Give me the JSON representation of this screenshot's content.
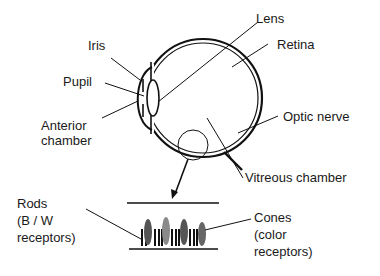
{
  "diagram": {
    "labels": {
      "lens": "Lens",
      "iris": "Iris",
      "retina": "Retina",
      "pupil": "Pupil",
      "anterior_chamber_1": "Anterior",
      "anterior_chamber_2": "chamber",
      "optic_nerve": "Optic nerve",
      "vitreous_chamber": "Vitreous chamber",
      "rods_1": "Rods",
      "rods_2": "(B / W",
      "rods_3": "receptors)",
      "cones_1": "Cones",
      "cones_2": "(color",
      "cones_3": "receptors)"
    },
    "colors": {
      "line": "#111111",
      "cone_dark": "#555555",
      "cone_light": "#8a8a8a",
      "background": "#ffffff"
    },
    "receptor_strip": {
      "sequence": [
        "rod",
        "rod",
        "cone",
        "rod",
        "rod",
        "rod",
        "cone",
        "rod",
        "rod",
        "rod",
        "cone",
        "rod",
        "rod",
        "rod",
        "cone"
      ]
    }
  }
}
